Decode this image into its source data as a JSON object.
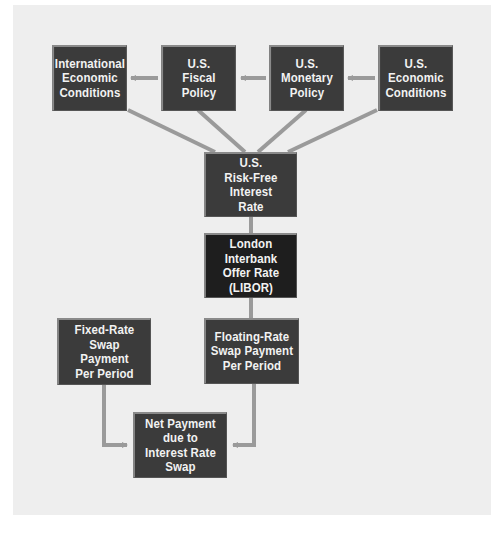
{
  "diagram": {
    "colors": {
      "panel": "#eeeeee",
      "box": "#3b3b3b",
      "box_dark": "#1e1e1e",
      "box_text": "#f2f2f2",
      "connector": "#9a9a9a"
    },
    "nodes": {
      "international": {
        "label": "International\nEconomic\nConditions"
      },
      "fiscal": {
        "label": "U.S.\nFiscal\nPolicy"
      },
      "monetary": {
        "label": "U.S.\nMonetary\nPolicy"
      },
      "economic": {
        "label": "U.S.\nEconomic\nConditions"
      },
      "risk_free": {
        "label": "U.S.\nRisk-Free\nInterest\nRate"
      },
      "libor": {
        "label": "London Interbank\nOffer Rate\n(LIBOR)"
      },
      "fixed": {
        "label": "Fixed-Rate\nSwap\nPayment\nPer Period"
      },
      "floating": {
        "label": "Floating-Rate\nSwap Payment\nPer Period"
      },
      "net": {
        "label": "Net Payment\ndue to\nInterest Rate\nSwap"
      }
    },
    "edges": [
      {
        "from": "fiscal",
        "to": "international"
      },
      {
        "from": "monetary",
        "to": "fiscal"
      },
      {
        "from": "economic",
        "to": "monetary"
      },
      {
        "from": "international",
        "to": "risk_free"
      },
      {
        "from": "fiscal",
        "to": "risk_free"
      },
      {
        "from": "monetary",
        "to": "risk_free"
      },
      {
        "from": "economic",
        "to": "risk_free"
      },
      {
        "from": "risk_free",
        "to": "libor"
      },
      {
        "from": "libor",
        "to": "floating"
      },
      {
        "from": "fixed",
        "to": "net"
      },
      {
        "from": "floating",
        "to": "net"
      }
    ]
  }
}
